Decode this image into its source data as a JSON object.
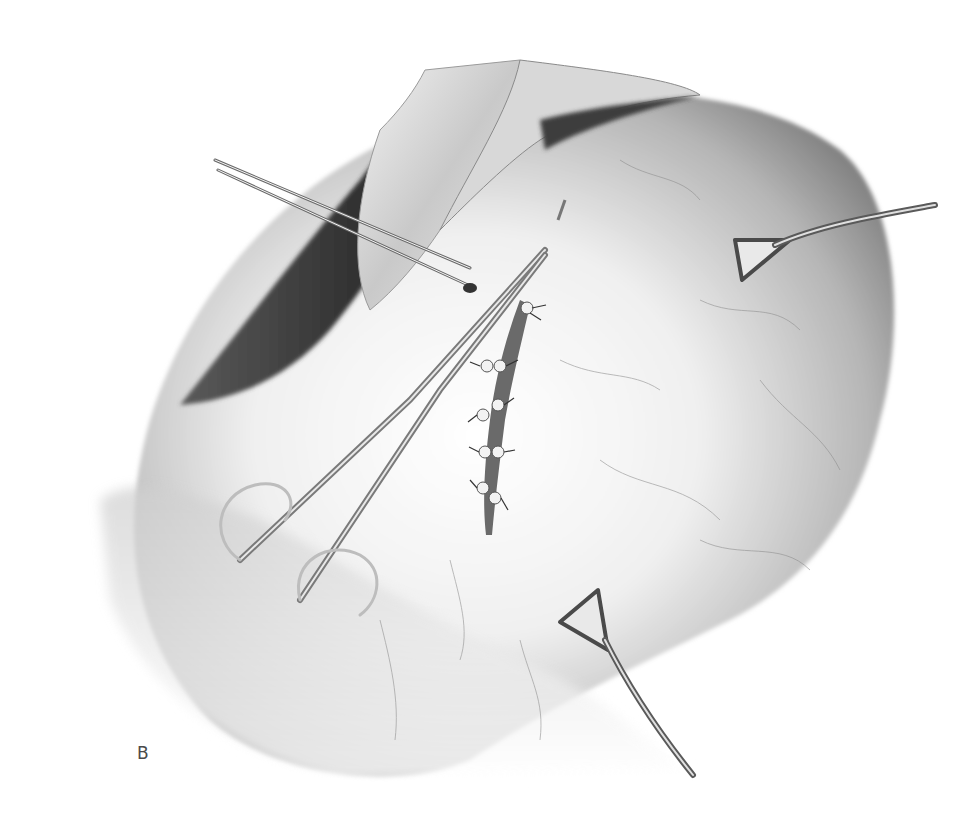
{
  "figure": {
    "panel_label": "B",
    "color_mode": "grayscale",
    "colors": {
      "background": "#ffffff",
      "tissue_light": "#efefef",
      "tissue_mid": "#b8b8b8",
      "tissue_dark": "#3a3a3a",
      "instrument": "#8a8a8a",
      "label": "#4a4a4a"
    },
    "elements": [
      {
        "name": "stomach",
        "desc": "large rounded organ occupying the right and center"
      },
      {
        "name": "retractor-flaps",
        "desc": "two retracted tissue flaps at top"
      },
      {
        "name": "incision-suture-line",
        "desc": "vertical sutured incision in center with knotted stitches"
      },
      {
        "name": "needle-holder",
        "desc": "scissor-type instrument with ring handles, lower-left to center"
      },
      {
        "name": "forceps",
        "desc": "long thin forceps from upper-left"
      },
      {
        "name": "babcock-clamp-right",
        "desc": "triangular clamp on right side"
      },
      {
        "name": "babcock-clamp-bottom",
        "desc": "triangular clamp at bottom"
      }
    ]
  }
}
